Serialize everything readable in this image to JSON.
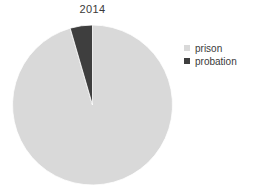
{
  "chart_data": {
    "type": "pie",
    "title": "2014",
    "categories": [
      "prison",
      "probation"
    ],
    "values": [
      95.5,
      4.5
    ],
    "colors": [
      "#d9d9d9",
      "#3e3e3e"
    ],
    "start_angle_deg": 0,
    "direction": "clockwise",
    "legend_position": "right",
    "xlabel": "",
    "ylabel": "",
    "grid": false,
    "labels_shown": false,
    "background": "#ffffff",
    "slices": [
      {
        "label": "prison",
        "value": 95.5,
        "color": "#d9d9d9",
        "start_deg": 0,
        "end_deg": 343.8
      },
      {
        "label": "probation",
        "value": 4.5,
        "color": "#3e3e3e",
        "start_deg": 343.8,
        "end_deg": 360
      }
    ]
  },
  "figure": {
    "title": "2014",
    "pie": {
      "center_x": 92.5,
      "center_y": 105,
      "radius": 80
    }
  },
  "legend": {
    "items": [
      {
        "label": "prison",
        "color": "#d9d9d9",
        "swatch_name": "legend-swatch-prison"
      },
      {
        "label": "probation",
        "color": "#3e3e3e",
        "swatch_name": "legend-swatch-probation"
      }
    ]
  }
}
